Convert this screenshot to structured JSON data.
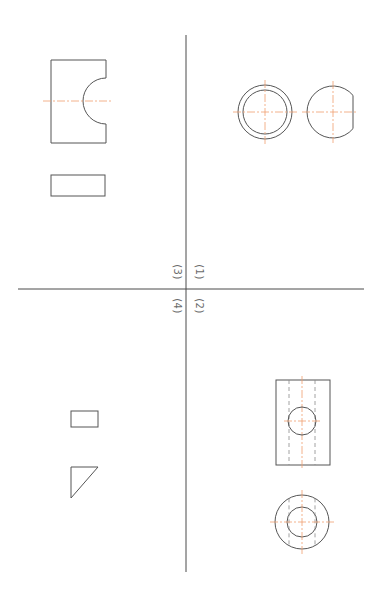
{
  "drawing": {
    "type": "orthographic projection exercise",
    "colors": {
      "outline": "#555555",
      "axis": "#4a4a4a",
      "centerline": "#f0a070",
      "hidden": "#8a8a8a",
      "label": "#6a6a6a",
      "background": "#ffffff"
    },
    "axes": {
      "vertical": {
        "x": 186,
        "y1": 35,
        "y2": 572
      },
      "horizontal": {
        "y": 289,
        "x1": 18,
        "x2": 364
      }
    },
    "quadrant_labels": [
      {
        "id": "q3",
        "text": "(3)",
        "x": 177,
        "y": 272
      },
      {
        "id": "q1",
        "text": "(1)",
        "x": 199,
        "y": 272
      },
      {
        "id": "q4",
        "text": "(4)",
        "x": 177,
        "y": 306
      },
      {
        "id": "q2",
        "text": "(2)",
        "x": 199,
        "y": 306
      }
    ],
    "quadrant_3": {
      "front_view": {
        "x": 51,
        "y": 60,
        "w": 55,
        "h": 83,
        "notch_center": [
          106,
          101
        ],
        "notch_r": 23
      },
      "top_view": {
        "x": 51,
        "y": 175,
        "w": 54,
        "h": 21
      }
    },
    "quadrant_1": {
      "ring_view": {
        "cx": 265,
        "cy": 112,
        "r_outer": 27,
        "r_inner": 22
      },
      "d_view": {
        "cx": 333,
        "cy": 112,
        "r": 26,
        "flat_x": 353
      }
    },
    "quadrant_4": {
      "small_rect": {
        "x": 71,
        "y": 411,
        "w": 27,
        "h": 16
      },
      "triangle": {
        "points": [
          [
            71,
            467
          ],
          [
            98,
            467
          ],
          [
            71,
            498
          ]
        ]
      }
    },
    "quadrant_2": {
      "front_view": {
        "x": 276,
        "y": 380,
        "w": 54,
        "h": 85,
        "hole_cx": 302,
        "hole_cy": 421,
        "hole_r": 14,
        "hidden_x": [
          289,
          315
        ]
      },
      "top_view": {
        "cx": 302,
        "cy": 522,
        "r_outer": 27,
        "r_inner": 15,
        "hidden_x": [
          289,
          315
        ]
      }
    }
  }
}
